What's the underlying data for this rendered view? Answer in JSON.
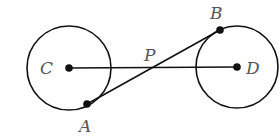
{
  "diagram": {
    "circles": [
      {
        "center_label": "C",
        "cx": 69,
        "cy": 68,
        "r": 42
      },
      {
        "center_label": "D",
        "cx": 237,
        "cy": 67,
        "r": 41
      }
    ],
    "points": {
      "C": {
        "label": "C",
        "x": 69,
        "y": 68
      },
      "D": {
        "label": "D",
        "x": 237,
        "y": 67
      },
      "A": {
        "label": "A",
        "x": 87,
        "y": 104
      },
      "B": {
        "label": "B",
        "x": 220,
        "y": 30
      },
      "P": {
        "label": "P",
        "x": 151,
        "y": 67
      }
    },
    "segments": [
      [
        "C",
        "D"
      ],
      [
        "A",
        "B"
      ]
    ],
    "colors": {
      "stroke": "#111111",
      "label": "#555555",
      "background": "#ffffff"
    }
  }
}
